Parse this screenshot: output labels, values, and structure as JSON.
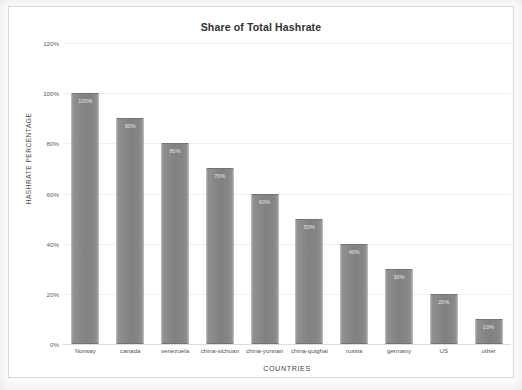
{
  "chart_data": {
    "type": "bar",
    "title": "Share of Total Hashrate",
    "xlabel": "COUNTRIES",
    "ylabel": "HASHRATE PERCENTAGE",
    "categories": [
      "Norway",
      "canada",
      "venezuela",
      "china-sichuan",
      "china-yunnan",
      "china-quighai",
      "russia",
      "germany",
      "US",
      "other"
    ],
    "values": [
      100,
      90,
      80,
      70,
      60,
      50,
      40,
      30,
      20,
      10
    ],
    "data_labels": [
      "100%",
      "90%",
      "80%",
      "70%",
      "60%",
      "50%",
      "40%",
      "30%",
      "20%",
      "10%"
    ],
    "ylim": [
      0,
      120
    ],
    "y_ticks": [
      0,
      20,
      40,
      60,
      80,
      100,
      120
    ],
    "y_tick_labels": [
      "0%",
      "20%",
      "40%",
      "60%",
      "80%",
      "100%",
      "120%"
    ],
    "grid": true,
    "legend": null,
    "bar_color": "#828282",
    "bar_border_color": "#6f6f6f",
    "background_color": "#ffffff",
    "frame_color": "#d8d8d8",
    "title_color": "#2b2b2b"
  }
}
